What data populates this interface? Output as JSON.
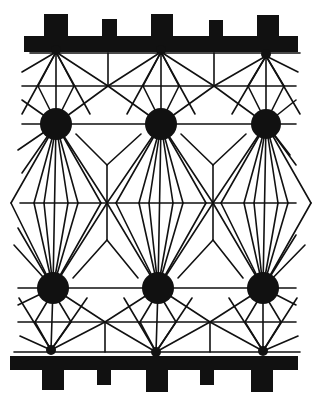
{
  "diagram": {
    "width": 316,
    "height": 406,
    "colors": {
      "ink": "#111111",
      "background": "#ffffff"
    },
    "line_width": 1.6,
    "top_rail": {
      "y": 36,
      "height": 16,
      "x1": 24,
      "x2": 298,
      "teeth": [
        {
          "x": 44,
          "w": 24,
          "y": 14,
          "h": 24
        },
        {
          "x": 102,
          "w": 15,
          "y": 19,
          "h": 19
        },
        {
          "x": 151,
          "w": 22,
          "y": 14,
          "h": 24
        },
        {
          "x": 209,
          "w": 14,
          "y": 20,
          "h": 18
        },
        {
          "x": 257,
          "w": 22,
          "y": 15,
          "h": 23
        }
      ]
    },
    "bottom_rail": {
      "y": 356,
      "height": 14,
      "x1": 10,
      "x2": 298,
      "teeth": [
        {
          "x": 42,
          "w": 22,
          "y": 368,
          "h": 22
        },
        {
          "x": 97,
          "w": 14,
          "y": 368,
          "h": 17
        },
        {
          "x": 146,
          "w": 22,
          "y": 368,
          "h": 24
        },
        {
          "x": 200,
          "w": 14,
          "y": 368,
          "h": 17
        },
        {
          "x": 251,
          "w": 22,
          "y": 368,
          "h": 24
        }
      ]
    },
    "top_guide_y": 53,
    "bottom_guide_y": 352,
    "nodes": [
      {
        "id": "n1",
        "x": 56,
        "y": 124,
        "r": 16
      },
      {
        "id": "n2",
        "x": 161,
        "y": 124,
        "r": 16
      },
      {
        "id": "n3",
        "x": 266,
        "y": 124,
        "r": 15
      },
      {
        "id": "n4",
        "x": 53,
        "y": 288,
        "r": 16
      },
      {
        "id": "n5",
        "x": 158,
        "y": 288,
        "r": 16
      },
      {
        "id": "n6",
        "x": 263,
        "y": 288,
        "r": 16
      }
    ],
    "anchors_top": [
      {
        "x": 56,
        "y": 52
      },
      {
        "x": 161,
        "y": 52
      },
      {
        "x": 266,
        "y": 56
      }
    ],
    "anchors_bottom": [
      {
        "x": 51,
        "y": 350
      },
      {
        "x": 156,
        "y": 352
      },
      {
        "x": 263,
        "y": 351
      }
    ],
    "junctions_top": [
      {
        "x": 108,
        "y": 86
      },
      {
        "x": 214,
        "y": 86
      }
    ],
    "junctions_bottom": [
      {
        "x": 105,
        "y": 322
      },
      {
        "x": 210,
        "y": 322
      }
    ],
    "mid_line_y": 203,
    "mid_junctions": [
      {
        "x": 107,
        "y": 203
      },
      {
        "x": 213,
        "y": 203
      }
    ]
  }
}
